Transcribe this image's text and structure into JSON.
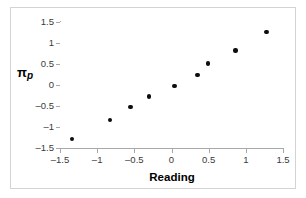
{
  "chart_data": {
    "type": "scatter",
    "title": "",
    "xlabel": "Reading",
    "ylabel": "πp",
    "ylabel_symbol": "π",
    "ylabel_subscript": "p",
    "xlim": [
      -1.5,
      1.5
    ],
    "ylim": [
      -1.5,
      1.5
    ],
    "xticks": [
      -1.5,
      -1,
      -0.5,
      0,
      0.5,
      1,
      1.5
    ],
    "xticklabels": [
      "-1.5",
      "-1",
      "-0.5",
      "0",
      "0.5",
      "1",
      "1.5"
    ],
    "yticks": [
      -1.5,
      -1,
      -0.5,
      0,
      0.5,
      1,
      1.5
    ],
    "yticklabels": [
      "-1.5",
      "-1",
      "-0.5",
      "0",
      "0.5",
      "1",
      "1.5"
    ],
    "grid": false,
    "legend": null,
    "marker_color": "#0d0d0d",
    "marker_shape": "circle",
    "points": [
      {
        "x": -1.34,
        "y": -1.28
      },
      {
        "x": -0.83,
        "y": -0.84
      },
      {
        "x": -0.55,
        "y": -0.52
      },
      {
        "x": -0.3,
        "y": -0.27
      },
      {
        "x": 0.04,
        "y": -0.02
      },
      {
        "x": 0.35,
        "y": 0.24
      },
      {
        "x": 0.49,
        "y": 0.51
      },
      {
        "x": 0.86,
        "y": 0.82
      },
      {
        "x": 1.28,
        "y": 1.26
      }
    ]
  },
  "style": {
    "frame_color": "#d3d3d3",
    "axis_color": "#a8a8a8",
    "tick_label_color": "#3a3a3a",
    "background": "#ffffff"
  }
}
